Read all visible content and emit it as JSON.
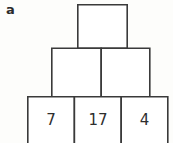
{
  "figure": {
    "panel_label": "a",
    "background_color": "#fdfdfb",
    "stroke_color": "#3a3a3a",
    "cell_fill_color": "#ffffff",
    "text_color": "#2e2e2e",
    "puzzle_type": "number-pyramid",
    "rows": [
      {
        "row_index": 0,
        "name": "apex-row",
        "cells": [
          {
            "id": "r0c0",
            "value": "",
            "filled": false
          }
        ]
      },
      {
        "row_index": 1,
        "name": "middle-row",
        "cells": [
          {
            "id": "r1c0",
            "value": "",
            "filled": false
          },
          {
            "id": "r1c1",
            "value": "",
            "filled": false
          }
        ]
      },
      {
        "row_index": 2,
        "name": "base-row",
        "cells": [
          {
            "id": "r2c0",
            "value": "7",
            "filled": true
          },
          {
            "id": "r2c1",
            "value": "17",
            "filled": true
          },
          {
            "id": "r2c2",
            "value": "4",
            "filled": true
          }
        ]
      }
    ]
  },
  "geometry": {
    "apex": {
      "x": 77,
      "y": 4,
      "w": 50,
      "h": 44
    },
    "middle_left": {
      "x": 51,
      "y": 48,
      "w": 50,
      "h": 49
    },
    "middle_right": {
      "x": 101,
      "y": 48,
      "w": 49,
      "h": 49
    },
    "base_left": {
      "x": 27,
      "y": 97,
      "w": 47,
      "h": 48
    },
    "base_center": {
      "x": 74,
      "y": 97,
      "w": 47,
      "h": 48
    },
    "base_right": {
      "x": 121,
      "y": 97,
      "w": 47,
      "h": 48
    }
  }
}
